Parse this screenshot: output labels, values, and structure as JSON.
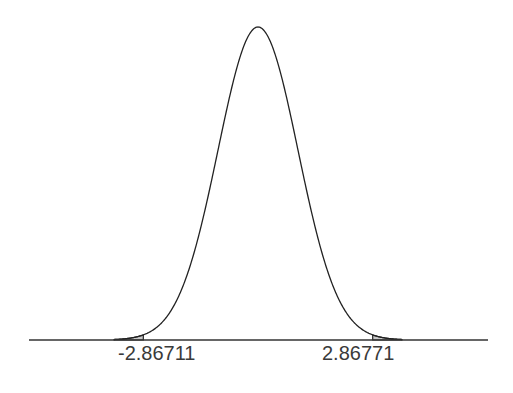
{
  "chart_data": {
    "type": "area",
    "title": "",
    "subtitle": "",
    "xlabel": "",
    "ylabel": "",
    "distribution": "normal",
    "mean": 0,
    "sd": 1,
    "x_range": [
      -5.75,
      5.75
    ],
    "grid": false,
    "legend": null,
    "critical_values": {
      "lower": -2.86711,
      "upper": 2.86771
    },
    "tick_labels": [
      "-2.86711",
      "2.86771"
    ],
    "shaded_regions": [
      {
        "from": -5.75,
        "to": -2.86711,
        "label": "lower tail"
      },
      {
        "from": 2.86771,
        "to": 5.75,
        "label": "upper tail"
      }
    ],
    "colors": {
      "curve": "#222222",
      "axis": "#333333",
      "shade": "#c8c8c8",
      "label": "#3a3a3a"
    }
  },
  "labels": {
    "lower": "-2.86711",
    "upper": "2.86771"
  }
}
